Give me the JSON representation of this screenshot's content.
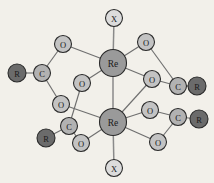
{
  "diagram": {
    "background_color": "#f2f0ea",
    "bond_color": "#6f6f6f",
    "axial_bond_color": "#8a8a8a",
    "outline_color": "#2b2b2b",
    "atom_styles": {
      "Re": {
        "fill": "#9a9a9a",
        "radius": 13.5,
        "font_size": 9.5,
        "label_color": "#1c1c1c"
      },
      "O": {
        "fill": "#c3c3c3",
        "radius": 8.5,
        "font_size": 8.5,
        "label_color": "#1c1c1c"
      },
      "C": {
        "fill": "#b2b2b2",
        "radius": 8.5,
        "font_size": 8.5,
        "label_color": "#1c1c1c"
      },
      "R": {
        "fill": "#6b6b6b",
        "radius": 9.0,
        "font_size": 8.5,
        "label_color": "#f0efe9"
      },
      "X": {
        "fill": "#dcdcdc",
        "radius": 8.5,
        "font_size": 8.5,
        "label_color": "#1c1c1c"
      }
    },
    "atoms": [
      {
        "id": "X-top",
        "element": "X",
        "label": "X",
        "x": 114,
        "y": 18,
        "name": "atom-x-axial-top"
      },
      {
        "id": "Re-top",
        "element": "Re",
        "label": "Re",
        "x": 113,
        "y": 63,
        "name": "atom-re-upper"
      },
      {
        "id": "Re-bottom",
        "element": "Re",
        "label": "Re",
        "x": 113,
        "y": 122,
        "name": "atom-re-lower"
      },
      {
        "id": "X-bottom",
        "element": "X",
        "label": "X",
        "x": 114,
        "y": 168,
        "name": "atom-x-axial-bottom"
      },
      {
        "id": "O-ul",
        "element": "O",
        "label": "O",
        "x": 63,
        "y": 44,
        "name": "atom-o-upper-left"
      },
      {
        "id": "O-ll",
        "element": "O",
        "label": "O",
        "x": 61,
        "y": 104,
        "name": "atom-o-lower-left"
      },
      {
        "id": "C-left",
        "element": "C",
        "label": "C",
        "x": 42,
        "y": 73,
        "name": "atom-c-left"
      },
      {
        "id": "R-left",
        "element": "R",
        "label": "R",
        "x": 17,
        "y": 73,
        "name": "atom-r-left"
      },
      {
        "id": "O-mid",
        "element": "O",
        "label": "O",
        "x": 82,
        "y": 83,
        "name": "atom-o-mid-left-front"
      },
      {
        "id": "O-bl",
        "element": "O",
        "label": "O",
        "x": 81,
        "y": 143,
        "name": "atom-o-bottom-left"
      },
      {
        "id": "C-bl",
        "element": "C",
        "label": "C",
        "x": 69,
        "y": 126,
        "name": "atom-c-bottom-left"
      },
      {
        "id": "R-bl",
        "element": "R",
        "label": "R",
        "x": 46,
        "y": 138,
        "name": "atom-r-bottom-left"
      },
      {
        "id": "O-ur",
        "element": "O",
        "label": "O",
        "x": 146,
        "y": 42,
        "name": "atom-o-upper-right"
      },
      {
        "id": "O-mr",
        "element": "O",
        "label": "O",
        "x": 152,
        "y": 79,
        "name": "atom-o-mid-right"
      },
      {
        "id": "C-right",
        "element": "C",
        "label": "C",
        "x": 178,
        "y": 86,
        "name": "atom-c-right"
      },
      {
        "id": "R-right",
        "element": "R",
        "label": "R",
        "x": 197,
        "y": 86,
        "name": "atom-r-right"
      },
      {
        "id": "O-mrl",
        "element": "O",
        "label": "O",
        "x": 150,
        "y": 110,
        "name": "atom-o-mid-right-lower"
      },
      {
        "id": "O-br",
        "element": "O",
        "label": "O",
        "x": 158,
        "y": 142,
        "name": "atom-o-bottom-right"
      },
      {
        "id": "C-br",
        "element": "C",
        "label": "C",
        "x": 178,
        "y": 117,
        "name": "atom-c-bottom-right"
      },
      {
        "id": "R-br",
        "element": "R",
        "label": "R",
        "x": 199,
        "y": 119,
        "name": "atom-r-bottom-right"
      }
    ],
    "bonds": [
      {
        "from": "X-top",
        "to": "Re-top",
        "style": "axial",
        "name": "bond-x-re-upper"
      },
      {
        "from": "Re-top",
        "to": "Re-bottom",
        "style": "axial",
        "name": "bond-re-re"
      },
      {
        "from": "Re-bottom",
        "to": "X-bottom",
        "style": "axial",
        "name": "bond-re-x-lower"
      },
      {
        "from": "Re-top",
        "to": "O-ul",
        "style": "normal",
        "name": "bond-re-upper-o-upper-left"
      },
      {
        "from": "O-ul",
        "to": "C-left",
        "style": "normal",
        "name": "bond-o-upper-left-c-left"
      },
      {
        "from": "C-left",
        "to": "R-left",
        "style": "normal",
        "name": "bond-c-left-r-left"
      },
      {
        "from": "C-left",
        "to": "O-ll",
        "style": "normal",
        "name": "bond-c-left-o-lower-left"
      },
      {
        "from": "O-ll",
        "to": "Re-bottom",
        "style": "normal",
        "name": "bond-o-lower-left-re-lower"
      },
      {
        "from": "Re-top",
        "to": "O-mid",
        "style": "normal",
        "name": "bond-re-upper-o-mid"
      },
      {
        "from": "O-mid",
        "to": "C-bl",
        "style": "normal",
        "name": "bond-o-mid-c-bottom-left"
      },
      {
        "from": "C-bl",
        "to": "R-bl",
        "style": "normal",
        "name": "bond-c-bottom-left-r-bottom-left"
      },
      {
        "from": "C-bl",
        "to": "O-bl",
        "style": "normal",
        "name": "bond-c-bottom-left-o-bottom-left"
      },
      {
        "from": "O-bl",
        "to": "Re-bottom",
        "style": "normal",
        "name": "bond-o-bottom-left-re-lower"
      },
      {
        "from": "Re-top",
        "to": "O-ur",
        "style": "normal",
        "name": "bond-re-upper-o-upper-right"
      },
      {
        "from": "O-ur",
        "to": "C-right",
        "style": "normal",
        "name": "bond-o-upper-right-c-right"
      },
      {
        "from": "C-right",
        "to": "R-right",
        "style": "normal",
        "name": "bond-c-right-r-right"
      },
      {
        "from": "C-right",
        "to": "O-mr",
        "style": "normal",
        "name": "bond-c-right-o-mid-right"
      },
      {
        "from": "O-mr",
        "to": "Re-top",
        "style": "normal",
        "name": "bond-o-mid-right-re-upper"
      },
      {
        "from": "O-mr",
        "to": "Re-bottom",
        "style": "normal",
        "name": "bond-o-mid-right-re-lower"
      },
      {
        "from": "Re-bottom",
        "to": "O-mrl",
        "style": "normal",
        "name": "bond-re-lower-o-mid-right-lower"
      },
      {
        "from": "O-mrl",
        "to": "C-br",
        "style": "normal",
        "name": "bond-o-mid-right-lower-c-bottom-right"
      },
      {
        "from": "C-br",
        "to": "R-br",
        "style": "normal",
        "name": "bond-c-bottom-right-r-bottom-right"
      },
      {
        "from": "C-br",
        "to": "O-br",
        "style": "normal",
        "name": "bond-c-bottom-right-o-bottom-right"
      },
      {
        "from": "O-br",
        "to": "Re-bottom",
        "style": "normal",
        "name": "bond-o-bottom-right-re-lower"
      }
    ]
  }
}
